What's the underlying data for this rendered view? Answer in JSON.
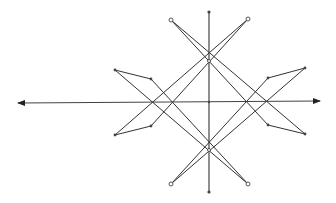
{
  "diagram": {
    "type": "geometric-star-construction",
    "background": "#ffffff",
    "stroke_color": "#333333",
    "horizontal_axis": {
      "x1": 18,
      "y1": 103,
      "x2": 320,
      "y2": 101,
      "arrows": "both"
    },
    "vertical_axis": {
      "x": 209,
      "y1": 12,
      "y2": 192,
      "end_dots": true
    },
    "center_point": {
      "x": 209,
      "y": 102
    },
    "axis_points": [
      {
        "x": 209,
        "y": 61
      },
      {
        "x": 209,
        "y": 150
      }
    ],
    "corner_circles": [
      {
        "name": "top-left",
        "x": 171,
        "y": 20
      },
      {
        "name": "top-right",
        "x": 248,
        "y": 19
      },
      {
        "name": "bottom-left",
        "x": 171,
        "y": 184
      },
      {
        "name": "bottom-right",
        "x": 248,
        "y": 184
      }
    ],
    "side_points": [
      {
        "name": "left-outer-top",
        "x": 115,
        "y": 70
      },
      {
        "name": "left-inner-top",
        "x": 151,
        "y": 79
      },
      {
        "name": "left-outer-bottom",
        "x": 115,
        "y": 135
      },
      {
        "name": "left-inner-bottom",
        "x": 151,
        "y": 126
      },
      {
        "name": "right-outer-top",
        "x": 305,
        "y": 68
      },
      {
        "name": "right-inner-top",
        "x": 268,
        "y": 78
      },
      {
        "name": "right-outer-bottom",
        "x": 305,
        "y": 134
      },
      {
        "name": "right-inner-bottom",
        "x": 268,
        "y": 125
      }
    ],
    "segments": [
      [
        171,
        20,
        305,
        134
      ],
      [
        171,
        20,
        268,
        125
      ],
      [
        248,
        19,
        115,
        135
      ],
      [
        248,
        19,
        151,
        126
      ],
      [
        171,
        184,
        305,
        68
      ],
      [
        171,
        184,
        268,
        78
      ],
      [
        248,
        184,
        115,
        70
      ],
      [
        248,
        184,
        151,
        79
      ],
      [
        115,
        70,
        151,
        79
      ],
      [
        115,
        135,
        151,
        126
      ],
      [
        305,
        68,
        268,
        78
      ],
      [
        305,
        134,
        268,
        125
      ]
    ]
  }
}
